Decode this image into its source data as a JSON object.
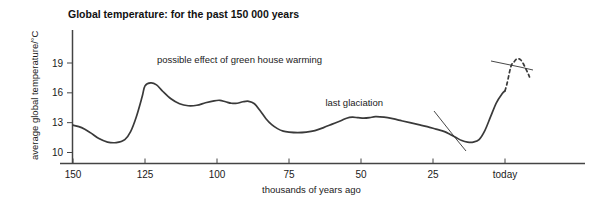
{
  "chart_data": {
    "type": "line",
    "title": "Global temperature: for the past 150 000 years",
    "xlabel": "thousands of years ago",
    "ylabel": "average global temperature/°C",
    "xlim": [
      150,
      -10
    ],
    "ylim": [
      10,
      20.5
    ],
    "grid": false,
    "legend": "none",
    "x_ticks": [
      {
        "value": 150,
        "label": "150"
      },
      {
        "value": 125,
        "label": "125"
      },
      {
        "value": 100,
        "label": "100"
      },
      {
        "value": 75,
        "label": "75"
      },
      {
        "value": 50,
        "label": "50"
      },
      {
        "value": 25,
        "label": "25"
      },
      {
        "value": 0,
        "label": "today"
      }
    ],
    "y_ticks": [
      {
        "value": 10,
        "label": "10"
      },
      {
        "value": 13,
        "label": "13"
      },
      {
        "value": 16,
        "label": "16"
      },
      {
        "value": 19,
        "label": "19"
      }
    ],
    "series": [
      {
        "name": "observed global temperature",
        "style": "solid",
        "x": [
          150,
          147,
          144,
          141,
          138,
          135,
          132,
          130,
          128,
          126,
          125,
          123,
          121,
          119,
          116,
          113,
          110,
          107,
          104,
          101,
          99,
          97,
          95,
          93,
          91,
          89,
          87,
          85,
          83,
          81,
          79,
          77,
          75,
          72,
          69,
          66,
          63,
          60,
          57,
          55,
          53,
          51,
          49,
          47,
          45,
          42,
          39,
          36,
          33,
          30,
          27,
          24,
          21,
          19,
          17,
          15,
          13,
          11,
          9,
          7,
          5,
          3,
          1,
          0
        ],
        "y": [
          12.75,
          12.5,
          12.0,
          11.4,
          11.05,
          11.0,
          11.3,
          12.1,
          13.6,
          15.6,
          16.7,
          17.0,
          16.8,
          16.2,
          15.4,
          14.9,
          14.7,
          14.75,
          15.0,
          15.2,
          15.25,
          15.1,
          14.95,
          14.95,
          15.1,
          15.15,
          14.9,
          14.2,
          13.4,
          12.8,
          12.4,
          12.15,
          12.05,
          12.0,
          12.05,
          12.2,
          12.5,
          12.85,
          13.2,
          13.45,
          13.55,
          13.5,
          13.45,
          13.5,
          13.6,
          13.55,
          13.4,
          13.2,
          13.0,
          12.8,
          12.6,
          12.35,
          12.1,
          11.8,
          11.5,
          11.2,
          11.05,
          11.05,
          11.3,
          12.2,
          13.6,
          15.0,
          15.9,
          16.2
        ]
      },
      {
        "name": "possible effect of green house warming (projection)",
        "style": "dashed",
        "x": [
          0,
          -0.5,
          -1.0,
          -1.5,
          -2.0,
          -2.5,
          -3.0,
          -3.5,
          -4.0,
          -4.5,
          -5.0,
          -5.5,
          -6.0,
          -6.5,
          -7.0,
          -7.5,
          -8.0,
          -8.5
        ],
        "y": [
          16.2,
          16.7,
          17.3,
          18.0,
          18.6,
          18.95,
          19.05,
          19.25,
          19.4,
          19.45,
          19.4,
          19.3,
          19.1,
          18.85,
          18.55,
          18.25,
          17.95,
          17.6
        ]
      }
    ],
    "annotations": [
      {
        "id": "greenhouse-warming",
        "text": "possible effect of green house warming",
        "text_x": 322,
        "text_y": 63,
        "leader": "M 491 61 L 520 67 L 533 70"
      },
      {
        "id": "last-glaciation",
        "text": "last glaciation",
        "text_x": 383,
        "text_y": 106,
        "leader": "M 434 111 L 457 140 L 466 151"
      }
    ],
    "colors": {
      "line": "#3a3a3a",
      "axis": "#444444",
      "text": "#1a1a1a",
      "background": "#ffffff"
    }
  }
}
